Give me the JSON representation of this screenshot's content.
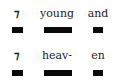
{
  "rows": [
    {
      "words": [
        "⁊",
        "young",
        "and"
      ]
    },
    {
      "words": [
        "⁊",
        "heav-",
        "en"
      ]
    }
  ]
}
